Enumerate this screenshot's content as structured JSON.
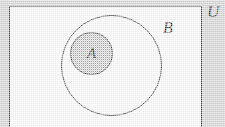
{
  "figure": {
    "kind": "venn-diagram",
    "universe": {
      "label": "U",
      "shape": "rectangle",
      "fill_color": "#fdfdfd",
      "stroke_color": "#4f4f4f"
    },
    "sets": [
      {
        "label": "B",
        "shape": "circle",
        "fill_color": "none",
        "stroke_color": "#4a4a4a",
        "center": [
          111,
          66
        ],
        "radius": 50
      },
      {
        "label": "A",
        "shape": "circle",
        "fill_color": "#c9c9c9",
        "stroke_color": "#4a4a4a",
        "center": [
          91,
          53
        ],
        "radius": 21
      }
    ],
    "background_color": "#d6d6d6"
  }
}
